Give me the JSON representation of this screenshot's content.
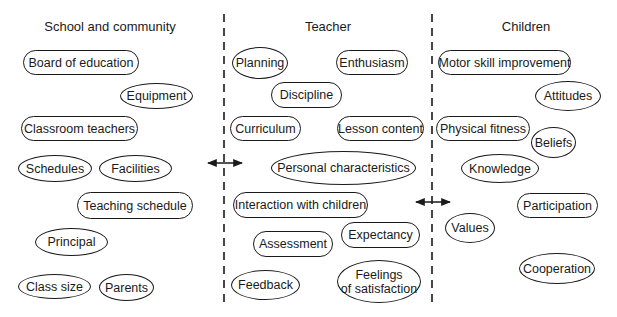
{
  "columns": [
    {
      "title": "School and community",
      "cx": 110
    },
    {
      "title": "Teacher",
      "cx": 328
    },
    {
      "title": "Children",
      "cx": 526
    }
  ],
  "dividers": [
    {
      "x": 224,
      "y1": 14,
      "y2": 302
    },
    {
      "x": 432,
      "y1": 14,
      "y2": 302
    }
  ],
  "arrows": [
    {
      "x1": 208,
      "x2": 242,
      "y": 163,
      "type": "bidirectional"
    },
    {
      "x1": 416,
      "x2": 450,
      "y": 202,
      "type": "bidirectional"
    }
  ],
  "nodes": {
    "school_and_community": [
      {
        "label": "Board of education",
        "shape": "pill",
        "x": 23,
        "y": 50,
        "w": 116,
        "h": 25
      },
      {
        "label": "Equipment",
        "shape": "ellipse",
        "x": 120,
        "y": 83,
        "w": 73,
        "h": 26
      },
      {
        "label": "Classroom teachers",
        "shape": "pill",
        "x": 21,
        "y": 116,
        "w": 117,
        "h": 25
      },
      {
        "label": "Schedules",
        "shape": "ellipse",
        "x": 18,
        "y": 155,
        "w": 74,
        "h": 27
      },
      {
        "label": "Facilities",
        "shape": "ellipse",
        "x": 99,
        "y": 155,
        "w": 73,
        "h": 27
      },
      {
        "label": "Teaching schedule",
        "shape": "pill",
        "x": 77,
        "y": 192,
        "w": 116,
        "h": 27
      },
      {
        "label": "Principal",
        "shape": "ellipse",
        "x": 35,
        "y": 228,
        "w": 73,
        "h": 28
      },
      {
        "label": "Class size",
        "shape": "ellipse",
        "x": 18,
        "y": 274,
        "w": 73,
        "h": 25
      },
      {
        "label": "Parents",
        "shape": "ellipse",
        "x": 99,
        "y": 274,
        "w": 55,
        "h": 27
      }
    ],
    "teacher": [
      {
        "label": "Planning",
        "shape": "ellipse",
        "x": 232,
        "y": 47,
        "w": 56,
        "h": 32
      },
      {
        "label": "Enthusiasm",
        "shape": "pill",
        "x": 336,
        "y": 50,
        "w": 72,
        "h": 25
      },
      {
        "label": "Discipline",
        "shape": "pill",
        "x": 271,
        "y": 82,
        "w": 71,
        "h": 26
      },
      {
        "label": "Curriculum",
        "shape": "pill",
        "x": 230,
        "y": 116,
        "w": 71,
        "h": 25
      },
      {
        "label": "Lesson content",
        "shape": "pill",
        "x": 337,
        "y": 116,
        "w": 87,
        "h": 25
      },
      {
        "label": "Personal characteristics",
        "shape": "ellipse",
        "x": 271,
        "y": 151,
        "w": 145,
        "h": 34
      },
      {
        "label": "Interaction with children",
        "shape": "pill",
        "x": 233,
        "y": 192,
        "w": 135,
        "h": 26
      },
      {
        "label": "Expectancy",
        "shape": "pill",
        "x": 341,
        "y": 222,
        "w": 79,
        "h": 26
      },
      {
        "label": "Assessment",
        "shape": "pill",
        "x": 253,
        "y": 231,
        "w": 80,
        "h": 26
      },
      {
        "label": "Feedback",
        "shape": "ellipse",
        "x": 231,
        "y": 270,
        "w": 69,
        "h": 30
      },
      {
        "label": "Feelings\nof satisfaction",
        "shape": "ellipse",
        "x": 337,
        "y": 260,
        "w": 84,
        "h": 43
      }
    ],
    "children": [
      {
        "label": "Motor skill improvement",
        "shape": "pill",
        "x": 438,
        "y": 50,
        "w": 133,
        "h": 25
      },
      {
        "label": "Attitudes",
        "shape": "ellipse",
        "x": 535,
        "y": 81,
        "w": 66,
        "h": 30
      },
      {
        "label": "Physical fitness",
        "shape": "pill",
        "x": 436,
        "y": 116,
        "w": 94,
        "h": 25
      },
      {
        "label": "Beliefs",
        "shape": "ellipse",
        "x": 531,
        "y": 127,
        "w": 45,
        "h": 31
      },
      {
        "label": "Knowledge",
        "shape": "ellipse",
        "x": 461,
        "y": 154,
        "w": 78,
        "h": 29
      },
      {
        "label": "Participation",
        "shape": "pill",
        "x": 517,
        "y": 193,
        "w": 81,
        "h": 25
      },
      {
        "label": "Values",
        "shape": "ellipse",
        "x": 445,
        "y": 213,
        "w": 50,
        "h": 30
      },
      {
        "label": "Cooperation",
        "shape": "ellipse",
        "x": 519,
        "y": 253,
        "w": 76,
        "h": 31
      }
    ]
  },
  "colors": {
    "stroke": "#1a1a1a",
    "background": "#ffffff"
  }
}
